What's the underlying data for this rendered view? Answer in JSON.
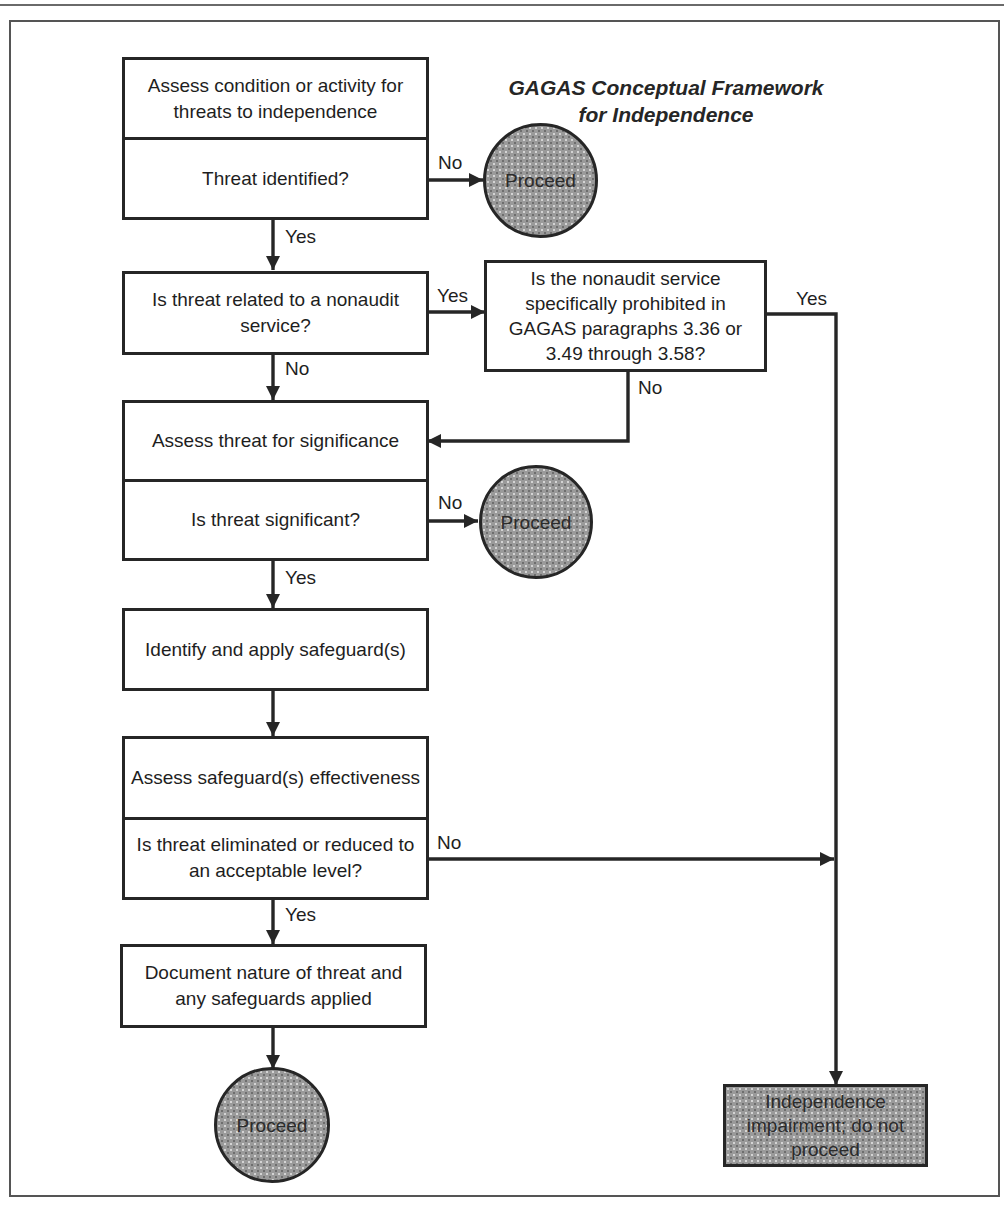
{
  "title": {
    "line1": "GAGAS Conceptual Framework",
    "line2": "for Independence"
  },
  "nodes": {
    "assess_condition": {
      "top": "Assess condition or activity for threats to independence",
      "bottom": "Threat identified?"
    },
    "proceed_1": "Proceed",
    "nonaudit_related": "Is threat related to a nonaudit service?",
    "prohibited": "Is the nonaudit service specifically prohibited in GAGAS paragraphs 3.36 or 3.49 through 3.58?",
    "assess_significance": {
      "top": "Assess threat for significance",
      "bottom": "Is threat significant?"
    },
    "proceed_2": "Proceed",
    "identify_safeguards": "Identify and apply safeguard(s)",
    "assess_safeguards": {
      "top": "Assess safeguard(s) effectiveness",
      "bottom": "Is threat eliminated or reduced to an acceptable level?"
    },
    "document": "Document nature of threat and any safeguards applied",
    "proceed_3": "Proceed",
    "impairment": "Independence impairment; do not proceed"
  },
  "edge_labels": {
    "threat_identified_no": "No",
    "threat_identified_yes": "Yes",
    "nonaudit_yes": "Yes",
    "nonaudit_no": "No",
    "prohibited_yes": "Yes",
    "prohibited_no": "No",
    "significant_no": "No",
    "significant_yes": "Yes",
    "eliminated_no": "No",
    "eliminated_yes": "Yes"
  },
  "colors": {
    "stroke": "#262626",
    "terminal_fill": "#9a9a9a",
    "background": "#ffffff"
  }
}
